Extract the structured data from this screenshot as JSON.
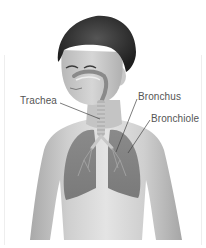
{
  "diagram": {
    "labels": [
      {
        "id": "trachea",
        "text": "Trachea",
        "x": 20,
        "y": 96,
        "target": [
          100,
          119
        ]
      },
      {
        "id": "bronchus",
        "text": "Bronchus",
        "x": 138,
        "y": 92,
        "target": [
          116,
          152
        ]
      },
      {
        "id": "bronchiole",
        "text": "Bronchiole",
        "x": 151,
        "y": 114,
        "target": [
          128,
          153
        ]
      }
    ]
  },
  "colors": {
    "background": "#ffffff",
    "skin_light": "#dcdcdc",
    "skin_mid": "#bdbdbd",
    "skin_dark": "#9a9a9a",
    "hair": "#2a2a2a",
    "lung": "#8e8e8e",
    "lung_dark": "#6f6f6f",
    "label_text": "#555555",
    "leader_line": "#444444"
  }
}
